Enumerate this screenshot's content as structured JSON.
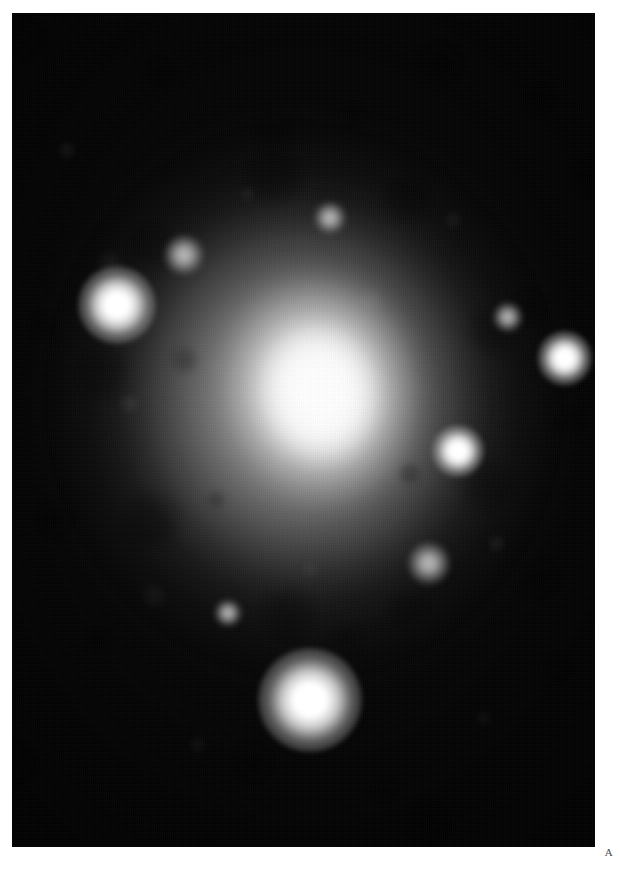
{
  "page": {
    "background_color": "#ffffff",
    "width": 619,
    "height": 870
  },
  "plate": {
    "label": "A",
    "frame": {
      "x": 12,
      "y": 13,
      "width": 583,
      "height": 834,
      "background_color": "#000000"
    },
    "caption_alt": "Grayscale astronomical photographic plate of an elliptical galaxy"
  },
  "image_content": {
    "type": "astronomical-photograph",
    "color_mode": "grayscale",
    "subject": "elliptical galaxy",
    "background_color": "#000000",
    "peak_color": "#ffffff",
    "galaxy": {
      "center_x_pct": 52.6,
      "center_y_pct": 45.6,
      "position_angle_deg": -10,
      "components": [
        {
          "name": "nucleus",
          "width_px": 128,
          "height_px": 148,
          "peak_gray": "#ffffff",
          "rotation_deg": -12
        },
        {
          "name": "inner-bulge",
          "width_px": 232,
          "height_px": 262,
          "peak_gray": "#f8f8f8",
          "rotation_deg": -10
        },
        {
          "name": "mid-envelope",
          "width_px": 400,
          "height_px": 430,
          "peak_gray": "#cdcdcd",
          "rotation_deg": -8
        },
        {
          "name": "outer-halo",
          "width_px": 560,
          "height_px": 600,
          "peak_gray": "#969696",
          "rotation_deg": -8
        }
      ]
    },
    "stars": [
      {
        "name": "star-west",
        "x_pct": 18.0,
        "y_pct": 35.0,
        "size_px": 30,
        "brightness": "bright"
      },
      {
        "name": "star-east",
        "x_pct": 94.8,
        "y_pct": 41.4,
        "size_px": 21,
        "brightness": "bright"
      },
      {
        "name": "star-south",
        "x_pct": 51.2,
        "y_pct": 82.4,
        "size_px": 40,
        "brightness": "bright"
      },
      {
        "name": "star-inner-east",
        "x_pct": 76.5,
        "y_pct": 52.5,
        "size_px": 20,
        "brightness": "bright"
      },
      {
        "name": "star-lower-east",
        "x_pct": 71.5,
        "y_pct": 66.0,
        "size_px": 16,
        "brightness": "faint"
      },
      {
        "name": "star-northwest",
        "x_pct": 29.5,
        "y_pct": 29.0,
        "size_px": 15,
        "brightness": "faint"
      },
      {
        "name": "star-north",
        "x_pct": 54.5,
        "y_pct": 24.6,
        "size_px": 12,
        "brightness": "faint"
      },
      {
        "name": "star-far-east",
        "x_pct": 85.0,
        "y_pct": 36.5,
        "size_px": 11,
        "brightness": "faint"
      },
      {
        "name": "star-south-west",
        "x_pct": 37.0,
        "y_pct": 72.0,
        "size_px": 10,
        "brightness": "faint"
      }
    ],
    "texture": {
      "description": "mottled pixelated photographic grain and blocky clumping in the halo",
      "grain_visible": true
    }
  }
}
